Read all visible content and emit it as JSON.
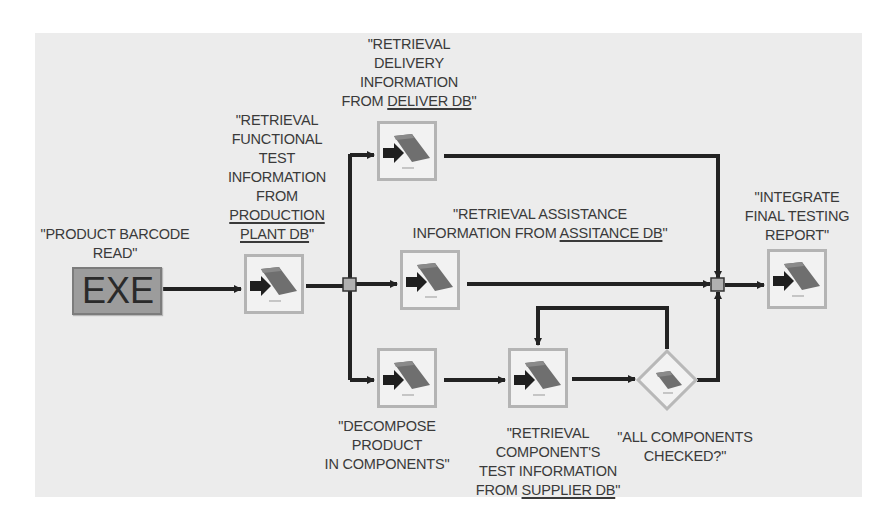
{
  "diagram": {
    "type": "workflow",
    "colors": {
      "panel": "#ececec",
      "wire": "#222222",
      "exe_fill": "#9c9c9c",
      "node_border": "#b4b4b4",
      "junction_fill": "#b0b0b0"
    },
    "start": {
      "label": "EXE",
      "caption": [
        "\"PRODUCT BARCODE",
        "READ\""
      ]
    },
    "nodes": {
      "production": {
        "icon": "database-task-icon",
        "caption_lines": [
          "\"RETRIEVAL",
          "FUNCTIONAL",
          "TEST",
          "INFORMATION",
          "FROM"
        ],
        "caption_underlined": [
          "PRODUCTION",
          "PLANT DB"
        ],
        "caption_end": "\""
      },
      "delivery": {
        "icon": "database-task-icon",
        "caption_lines": [
          "\"RETRIEVAL",
          "DELIVERY",
          "INFORMATION"
        ],
        "caption_prefix": "FROM ",
        "caption_underlined": "DELIVER DB",
        "caption_end": "\""
      },
      "assistance": {
        "icon": "database-task-icon",
        "caption_line1": "\"RETRIEVAL ASSISTANCE",
        "caption_prefix": "INFORMATION FROM ",
        "caption_underlined": "ASSITANCE DB",
        "caption_end": "\""
      },
      "decompose": {
        "icon": "database-task-icon",
        "caption_lines": [
          "\"DECOMPOSE",
          "PRODUCT",
          "IN COMPONENTS\""
        ]
      },
      "supplier": {
        "icon": "database-task-icon",
        "caption_lines": [
          "\"RETRIEVAL",
          "COMPONENT'S",
          "TEST INFORMATION"
        ],
        "caption_prefix": "FROM ",
        "caption_underlined": "SUPPLIER DB",
        "caption_end": "\""
      },
      "check": {
        "icon": "decision-diamond-icon",
        "caption_lines": [
          "\"ALL COMPONENTS",
          "CHECKED?\""
        ]
      },
      "integrate": {
        "icon": "database-task-icon",
        "caption_lines": [
          "\"INTEGRATE",
          "FINAL TESTING",
          "REPORT\""
        ]
      }
    },
    "edges": [
      {
        "from": "EXE",
        "to": "production"
      },
      {
        "from": "production",
        "to": "split-junction"
      },
      {
        "from": "split-junction",
        "to": "delivery"
      },
      {
        "from": "split-junction",
        "to": "assistance"
      },
      {
        "from": "split-junction",
        "to": "decompose"
      },
      {
        "from": "decompose",
        "to": "supplier"
      },
      {
        "from": "supplier",
        "to": "check"
      },
      {
        "from": "check",
        "to": "supplier",
        "kind": "loop-back"
      },
      {
        "from": "check",
        "to": "merge-junction"
      },
      {
        "from": "delivery",
        "to": "merge-junction"
      },
      {
        "from": "assistance",
        "to": "merge-junction"
      },
      {
        "from": "merge-junction",
        "to": "integrate"
      }
    ]
  }
}
